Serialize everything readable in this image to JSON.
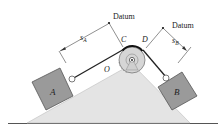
{
  "diagram": {
    "labels": {
      "datum_left": "Datum",
      "datum_right": "Datum",
      "s_a_main": "s",
      "s_a_sub": "A",
      "s_b_main": "s",
      "s_b_sub": "B",
      "point_c": "C",
      "point_d": "D",
      "point_o": "O",
      "block_a": "A",
      "block_b": "B"
    },
    "colors": {
      "wedge": "#e4e4e4",
      "block": "#9a9a9a",
      "pulley": "#d6d6d6",
      "line": "#222222",
      "ground": "#555555"
    }
  }
}
